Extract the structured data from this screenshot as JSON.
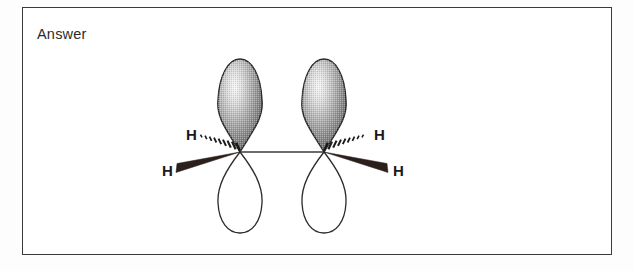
{
  "page": {
    "background_color": "#fdfdfd",
    "frame": {
      "label": "Answer",
      "border_color": "#3a3a3a",
      "fill_color": "#ffffff"
    }
  },
  "diagram": {
    "name": "ethene-pi-bond-orbital-diagram",
    "colors": {
      "lobe_outline": "#2b2b2b",
      "lobe_shade_dark": "#6e6e6e",
      "lobe_shade_light": "#f2f2f2",
      "lower_lobe_fill": "#ffffff",
      "wedge_solid": "#2a1f1a",
      "bond_line": "#3a3a3a",
      "label_color": "#1a1a1a"
    },
    "sigma_bond": {
      "label": "sigma-bond",
      "from": "C-left",
      "to": "C-right"
    },
    "atoms": [
      {
        "id": "C-left",
        "element": "C",
        "cx": 240,
        "cy": 152,
        "p_orbital": {
          "upper_lobe": "shaded",
          "lower_lobe": "unfilled"
        },
        "hydrogens": [
          {
            "label": "H",
            "bond_style": "hashed-wedge",
            "position": "upper-left",
            "x": 186,
            "y": 134
          },
          {
            "label": "H",
            "bond_style": "solid-wedge",
            "position": "lower-left",
            "x": 163,
            "y": 170
          }
        ]
      },
      {
        "id": "C-right",
        "element": "C",
        "cx": 324,
        "cy": 152,
        "p_orbital": {
          "upper_lobe": "shaded",
          "lower_lobe": "unfilled"
        },
        "hydrogens": [
          {
            "label": "H",
            "bond_style": "hashed-wedge",
            "position": "upper-right",
            "x": 377,
            "y": 134
          },
          {
            "label": "H",
            "bond_style": "solid-wedge",
            "position": "lower-right",
            "x": 394,
            "y": 170
          }
        ]
      }
    ],
    "labels": {
      "h_upper_left": "H",
      "h_lower_left": "H",
      "h_upper_right": "H",
      "h_lower_right": "H"
    }
  }
}
